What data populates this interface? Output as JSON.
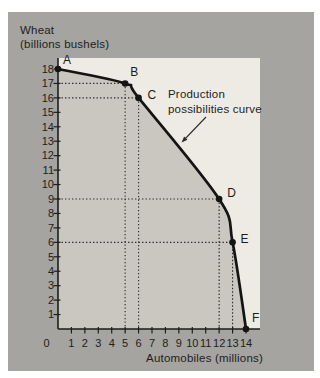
{
  "figure": {
    "y_axis_title_line1": "Wheat",
    "y_axis_title_line2": "(billions bushels)",
    "x_axis_title": "Automobiles (millions)"
  },
  "colors": {
    "page_background": "#ffffff",
    "panel_background": "#a5a4a1",
    "plot_background": "#edebe3",
    "under_curve_fill": "#c9c7c0",
    "ink": "#1e1d1b",
    "curve": "#141412",
    "dotted_guide": "#2e2d2b"
  },
  "chart_data": {
    "type": "line",
    "title": "",
    "xlabel": "Automobiles (millions)",
    "ylabel": "Wheat (billions bushels)",
    "ylabel_lines": [
      "Wheat",
      "(billions bushels)"
    ],
    "grid": false,
    "legend": false,
    "x_axis": {
      "min": 0,
      "max": 14,
      "tick_labels": [
        0,
        1,
        2,
        3,
        4,
        5,
        6,
        7,
        8,
        9,
        10,
        11,
        12,
        13,
        14
      ]
    },
    "y_axis": {
      "min": 0,
      "max": 18,
      "tick_labels": [
        1,
        2,
        3,
        4,
        5,
        6,
        7,
        8,
        9,
        10,
        11,
        12,
        13,
        14,
        15,
        16,
        17,
        18
      ]
    },
    "series": [
      {
        "name": "Production possibilities curve",
        "points": [
          {
            "label": "A",
            "x": 0,
            "y": 18,
            "guides": false,
            "dx": 5,
            "dy": -5
          },
          {
            "label": "B",
            "x": 5,
            "y": 17,
            "guides": true,
            "dx": 5,
            "dy": -7
          },
          {
            "label": "C",
            "x": 6,
            "y": 16,
            "guides": true,
            "dx": 9,
            "dy": 1
          },
          {
            "label": "D",
            "x": 12,
            "y": 9,
            "guides": true,
            "dx": 8,
            "dy": -2
          },
          {
            "label": "E",
            "x": 13,
            "y": 6,
            "guides": true,
            "dx": 8,
            "dy": 1
          },
          {
            "label": "F",
            "x": 14,
            "y": 0,
            "guides": false,
            "dx": 6,
            "dy": -7
          }
        ]
      }
    ],
    "annotation": {
      "lines": [
        "Production",
        "possibilities curve"
      ],
      "x": 168,
      "y": 98,
      "line_height": 15,
      "arrow": {
        "x1": 206,
        "y1": 117,
        "x2": 183,
        "y2": 141
      }
    }
  }
}
